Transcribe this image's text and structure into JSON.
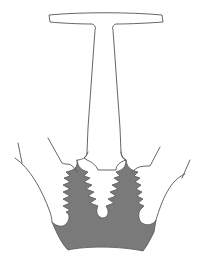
{
  "figure": {
    "colors": {
      "background": "#ffffff",
      "outline": "#555555",
      "disk_fill": "#7a7a7a",
      "blade_fill": "#ffffff"
    },
    "parts": [
      {
        "name": "blade-platform",
        "label": "Blade platform (T-top)"
      },
      {
        "name": "blade-stem",
        "label": "Blade neck/stem"
      },
      {
        "name": "fir-tree-root",
        "label": "Fir-tree root"
      },
      {
        "name": "disk",
        "label": "Disk (shaded)"
      }
    ]
  }
}
